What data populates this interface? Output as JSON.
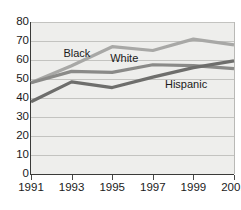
{
  "chart_data": {
    "type": "line",
    "title": "",
    "xlabel": "",
    "ylabel": "",
    "categories": [
      "1991",
      "1993",
      "1995",
      "1997",
      "1999",
      "2001"
    ],
    "x": [
      1991,
      1993,
      1995,
      1997,
      1999,
      2001
    ],
    "xlim": [
      1991,
      2001
    ],
    "ylim": [
      0,
      80
    ],
    "yticks": [
      0,
      10,
      20,
      30,
      40,
      50,
      60,
      70,
      80
    ],
    "ytick_labels": [
      "0",
      "10",
      "20",
      "30",
      "40",
      "50",
      "60",
      "70",
      "80"
    ],
    "grid": true,
    "legend": "inline-labels",
    "series": [
      {
        "name": "Black",
        "color": "#a8a8a6",
        "values": [
          48,
          57,
          67,
          65,
          71,
          68
        ],
        "label_text": "Black"
      },
      {
        "name": "White",
        "color": "#8a8a88",
        "values": [
          48,
          54,
          53.5,
          57.5,
          57,
          55.5
        ],
        "label_text": "White"
      },
      {
        "name": "Hispanic",
        "color": "#6e6e6c",
        "values": [
          38,
          48.5,
          45.5,
          51,
          56,
          59.5
        ],
        "label_text": "Hispanic"
      }
    ],
    "annotations": [
      {
        "text": "Black",
        "x": 1992.6,
        "y": 63
      },
      {
        "text": "White",
        "x": 1994.9,
        "y": 60.5
      },
      {
        "text": "Hispanic",
        "x": 1997.6,
        "y": 47
      }
    ]
  },
  "colors": {
    "plot_background": "#eeeeec",
    "gridline": "#c3c3c0",
    "axis": "#3a3a38",
    "text": "#1a1a1a"
  }
}
